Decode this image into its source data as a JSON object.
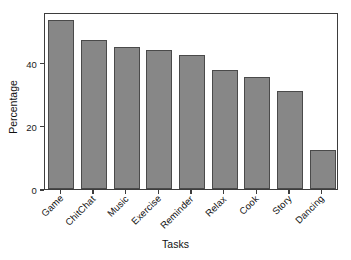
{
  "chart_data": {
    "type": "bar",
    "title": "",
    "xlabel": "Tasks",
    "ylabel": "Percentage",
    "categories": [
      "Game",
      "ChitChat",
      "Music",
      "Exercise",
      "Reminder",
      "Relax",
      "Cook",
      "Story",
      "Dancing"
    ],
    "values": [
      53.5,
      47,
      45,
      44,
      42.5,
      37.5,
      35.5,
      31,
      12.5
    ],
    "ylim": [
      0,
      56
    ],
    "yticks": [
      0,
      20,
      40
    ],
    "ytick_labels": [
      "0",
      "20",
      "40"
    ],
    "grid": false,
    "legend": null,
    "bar_color": "#878787",
    "bar_edge_color": "#4a4a4a",
    "axes_color": "#3d3d3d",
    "background_color": "#ffffff"
  }
}
